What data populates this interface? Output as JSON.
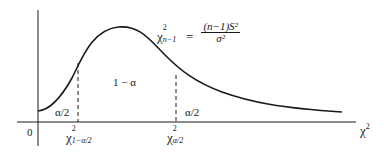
{
  "diagram": {
    "colors": {
      "stroke": "#1a1a1a",
      "background": "#ffffff"
    },
    "axes": {
      "origin_label": "0",
      "x_axis_label": {
        "base": "χ",
        "sup": "2"
      }
    },
    "formula": {
      "lhs": {
        "base": "χ",
        "sup": "2",
        "sub": "n−1"
      },
      "equals": "=",
      "numerator": "(n−1)S²",
      "denominator": "σ²"
    },
    "regions": {
      "left_tail": "α/2",
      "center": "1 − α",
      "right_tail": "α/2"
    },
    "critical_values": {
      "lower": {
        "base": "χ",
        "sup": "2",
        "sub": "1−α/2"
      },
      "upper": {
        "base": "χ",
        "sup": "2",
        "sub": "α/2"
      }
    }
  }
}
